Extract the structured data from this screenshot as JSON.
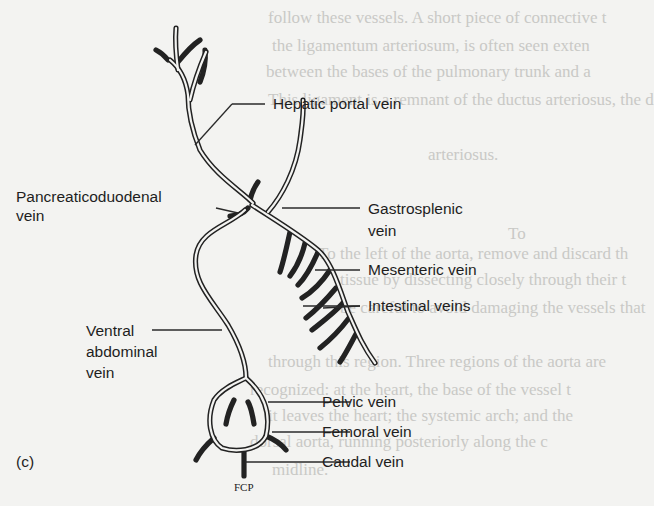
{
  "figure": {
    "panel_label": "(c)",
    "artist_initials": "FCP",
    "labels": {
      "hepatic_portal": "Hepatic portal vein",
      "pancreaticoduodenal_1": "Pancreaticoduodenal",
      "pancreaticoduodenal_2": "vein",
      "gastrosplenic_1": "Gastrosplenic",
      "gastrosplenic_2": "vein",
      "mesenteric": "Mesenteric vein",
      "intestinal": "Intestinal veins",
      "ventral_1": "Ventral",
      "ventral_2": "abdominal",
      "ventral_3": "vein",
      "pelvic": "Pelvic vein",
      "femoral": "Femoral vein",
      "caudal": "Caudal vein"
    }
  },
  "bleed_through_text": {
    "line1": "follow these vessels. A short piece of connective t",
    "line2": "the ligamentum arteriosum, is often seen exten",
    "line3": "between the bases of the pulmonary trunk and a",
    "line4": "This ligament is a remnant of the ductus arteriosus, the d",
    "line5": "arteriosus.",
    "line6": "To",
    "line7": "To the left of the aorta, remove and discard th",
    "line8": "tissue by dissecting closely through their t",
    "line9": "be careful to avoid damaging the vessels that",
    "line10": "through this region. Three regions of the aorta are",
    "line11": "recognized: at the heart, the base of the vessel t",
    "line12": "it leaves the heart; the systemic arch; and the",
    "line13": "dorsal aorta, running posteriorly along the c",
    "line14": "midline."
  }
}
